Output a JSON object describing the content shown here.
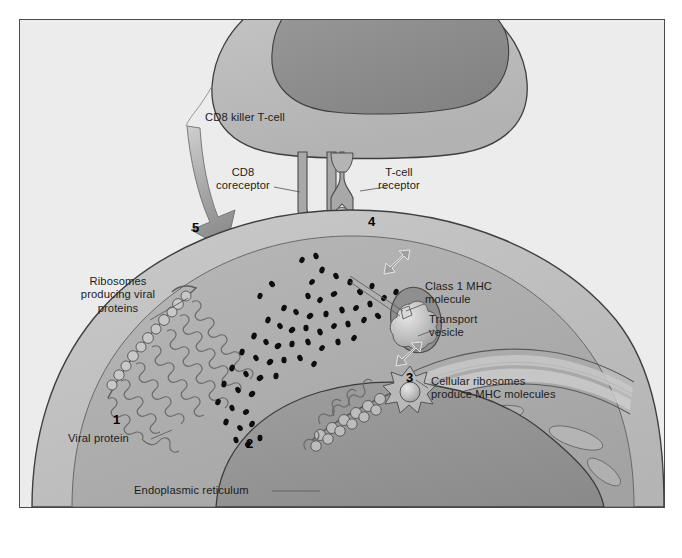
{
  "figure": {
    "title_visible": false,
    "background_color": "#ececec",
    "frame_border_color": "#4a4a4a",
    "type": "biological-process-diagram"
  },
  "palette": {
    "page_background": "#ffffff",
    "panel_background": "#ececec",
    "tcell_cytoplasm": "#b9b9b9",
    "tcell_nucleus": "#8d8d8d",
    "infected_cell_cytoplasm": "#bdbdbd",
    "infected_cell_inner": "#ababab",
    "infected_cell_nucleus": "#949494",
    "er_band": "#c6c6c6",
    "outline": "#404040",
    "viral_protein_dot": "#0d0d0d",
    "arrow_fill": "#9a9a9a",
    "receptor_fill": "#a6a6a6",
    "vesicle_fill": "#8f8f8f",
    "label_text": "#1c1c1c"
  },
  "labels": {
    "tcell": "CD8 killer T-cell",
    "cd8_coreceptor": "CD8\ncoreceptor",
    "tcell_receptor": "T-cell\nreceptor",
    "ribosomes_viral": "Ribosomes\nproducing viral\nproteins",
    "viral_protein": "Viral protein",
    "class1_mhc": "Class 1 MHC\nmolecule",
    "transport_vesicle": "Transport\nvesicle",
    "cellular_ribosomes": "Cellular ribosomes\nproduce MHC molecules",
    "endoplasmic_reticulum": "Endoplasmic reticulum"
  },
  "steps": [
    {
      "number": "1",
      "describes": "Ribosomes producing viral proteins"
    },
    {
      "number": "2",
      "describes": "Viral protein fragments in cytoplasm"
    },
    {
      "number": "3",
      "describes": "Cellular ribosomes produce MHC molecules"
    },
    {
      "number": "4",
      "describes": "T-cell receptor binds MHC-peptide complex"
    },
    {
      "number": "5",
      "describes": "CD8 killer T-cell kills infected cell"
    }
  ],
  "step_positions": {
    "one": "1",
    "two": "2",
    "three": "3",
    "four": "4",
    "five": "5"
  }
}
